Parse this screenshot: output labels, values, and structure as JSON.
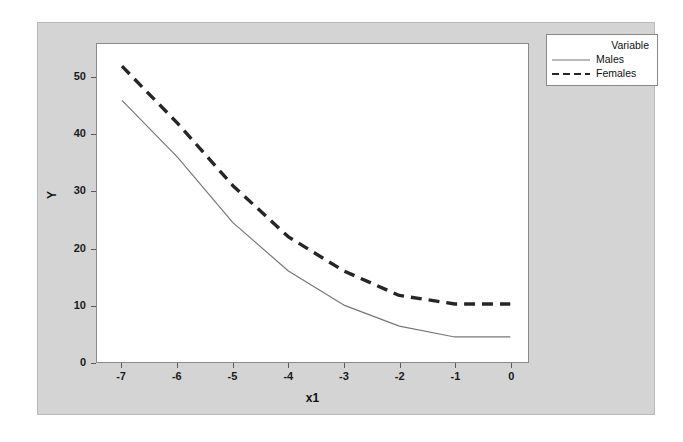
{
  "chart_data": {
    "type": "line",
    "title": "",
    "xlabel": "x1",
    "ylabel": "Y",
    "xlim": [
      -7.45,
      0.32
    ],
    "ylim": [
      0,
      55.9
    ],
    "grid": false,
    "legend_position": "right-top",
    "legend_title": "Variable",
    "x": [
      -7,
      -6,
      -5,
      -4,
      -3,
      -2,
      -1,
      0
    ],
    "xticks": [
      "-7",
      "-6",
      "-5",
      "-4",
      "-3",
      "-2",
      "-1",
      "0"
    ],
    "yticks": [
      "0",
      "10",
      "20",
      "30",
      "40",
      "50"
    ],
    "ytick_values": [
      0,
      10,
      20,
      30,
      40,
      50
    ],
    "xtick_values": [
      -7,
      -6,
      -5,
      -4,
      -3,
      -2,
      -1,
      0
    ],
    "series": [
      {
        "name": "Males",
        "style": "solid",
        "color": "#777777",
        "values": [
          46.0,
          36.0,
          24.5,
          16.0,
          10.0,
          6.3,
          4.4,
          4.4
        ]
      },
      {
        "name": "Females",
        "style": "dashed",
        "color": "#262626",
        "values": [
          52.0,
          42.0,
          31.0,
          22.0,
          16.0,
          11.7,
          10.2,
          10.2
        ]
      }
    ]
  },
  "legend": {
    "title": "Variable",
    "entries": [
      {
        "label": "Males",
        "swatch": "solid-line-swatch"
      },
      {
        "label": "Females",
        "swatch": "dashed-line-swatch"
      }
    ]
  },
  "axes": {
    "x_title": "x1",
    "y_title": "Y"
  },
  "colors": {
    "panel_background": "#d4d4d4",
    "plot_background": "#ffffff",
    "axis_line": "#8a8a8a",
    "males_line": "#777777",
    "females_line": "#262626",
    "text": "#111111"
  }
}
